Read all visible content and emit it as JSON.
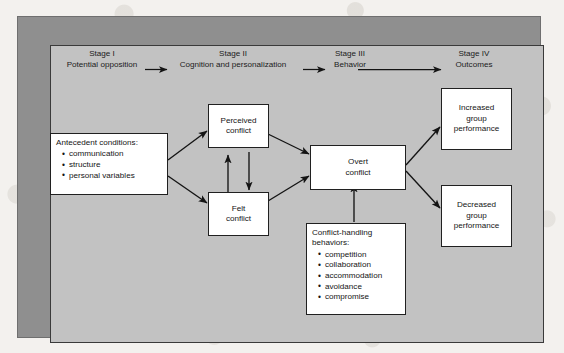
{
  "figure": {
    "colors": {
      "outer_frame": "#8f8f8f",
      "panel": "#c2c2c2",
      "box_fill": "#ffffff",
      "ink": "#141414"
    },
    "stages": [
      {
        "number": "Stage I",
        "name": "Potential opposition"
      },
      {
        "number": "Stage II",
        "name": "Cognition and personalization"
      },
      {
        "number": "Stage III",
        "name": "Behavior"
      },
      {
        "number": "Stage IV",
        "name": "Outcomes"
      }
    ],
    "nodes": {
      "antecedent": {
        "title": "Antecedent conditions:",
        "items": [
          "communication",
          "structure",
          "personal variables"
        ]
      },
      "perceived_conflict": {
        "line1": "Perceived",
        "line2": "conflict"
      },
      "felt_conflict": {
        "line1": "Felt",
        "line2": "conflict"
      },
      "overt_conflict": {
        "line1": "Overt",
        "line2": "conflict"
      },
      "conflict_handling": {
        "title_line1": "Conflict-handling",
        "title_line2": "behaviors:",
        "items": [
          "competition",
          "collaboration",
          "accommodation",
          "avoidance",
          "compromise"
        ]
      },
      "increased_performance": {
        "line1": "Increased",
        "line2": "group",
        "line3": "performance"
      },
      "decreased_performance": {
        "line1": "Decreased",
        "line2": "group",
        "line3": "performance"
      }
    }
  }
}
